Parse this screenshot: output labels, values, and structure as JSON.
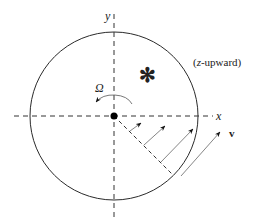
{
  "diagram": {
    "labels": {
      "x_axis": "x",
      "y_axis": "y",
      "omega": "Ω",
      "velocity": "v",
      "orientation_note_open": "(",
      "orientation_note_z": "z",
      "orientation_note_rest": "-upward)",
      "star": "✻"
    },
    "geometry": {
      "center": [
        114,
        116
      ],
      "radius": 84,
      "velocity_arrows_count": 4
    },
    "colors": {
      "stroke": "#2a2a2a",
      "arrow": "#555555",
      "background": "#ffffff"
    }
  }
}
